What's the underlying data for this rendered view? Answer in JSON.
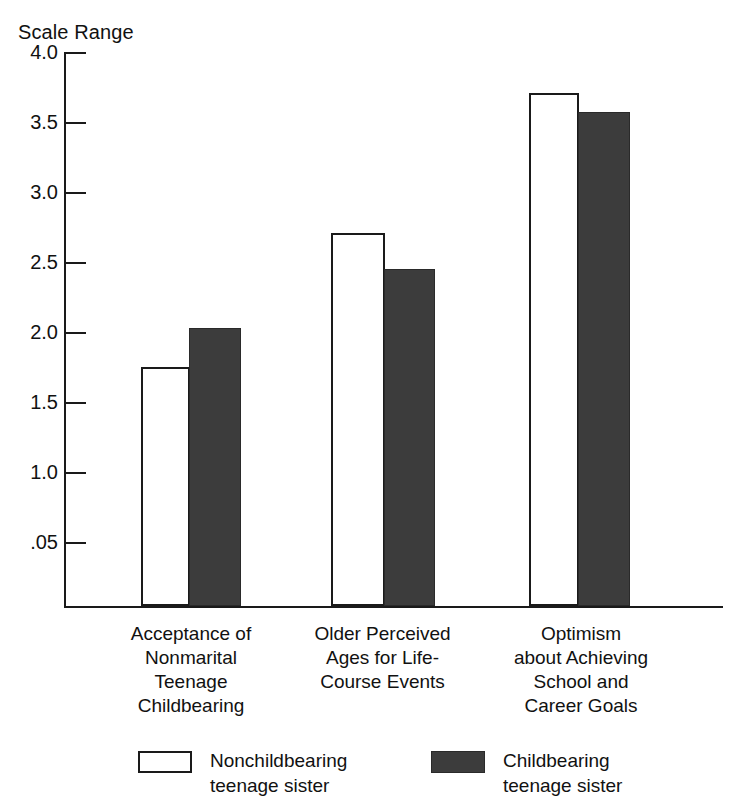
{
  "chart_data": {
    "type": "bar",
    "title": "Scale Range",
    "xlabel": "",
    "ylabel": "Scale Range",
    "ylim": [
      0,
      4.0
    ],
    "grid": false,
    "legend_position": "bottom",
    "y_ticks": [
      "4.0",
      "3.5",
      "3.0",
      "2.5",
      "2.0",
      "1.5",
      "1.0",
      ".05"
    ],
    "y_tick_values": [
      4.0,
      3.5,
      3.0,
      2.5,
      2.0,
      1.5,
      1.0,
      0.5
    ],
    "categories": [
      "Acceptance of Nonmarital Teenage Childbearing",
      "Older Perceived Ages for Life-Course Events",
      "Optimism about Achieving School and Career Goals"
    ],
    "category_lines": [
      [
        "Acceptance of",
        "Nonmarital",
        "Teenage",
        "Childbearing"
      ],
      [
        "Older Perceived",
        "Ages for Life-",
        "Course Events"
      ],
      [
        "Optimism",
        "about Achieving",
        "School and",
        "Career Goals"
      ]
    ],
    "series": [
      {
        "name": "Nonchildbearing teenage sister",
        "color": "#ffffff",
        "values": [
          1.75,
          2.71,
          3.71
        ]
      },
      {
        "name": "Childbearing teenage sister",
        "color": "#3c3c3c",
        "values": [
          2.03,
          2.45,
          3.57
        ]
      }
    ]
  },
  "legend": {
    "items": [
      {
        "swatch": "light",
        "line1": "Nonchildbearing",
        "line2": "teenage sister"
      },
      {
        "swatch": "dark",
        "line1": "Childbearing",
        "line2": "teenage sister"
      }
    ]
  },
  "ticks": {
    "t0": "4.0",
    "t1": "3.5",
    "t2": "3.0",
    "t3": "2.5",
    "t4": "2.0",
    "t5": "1.5",
    "t6": "1.0",
    "t7": ".05"
  },
  "categories": {
    "c0": {
      "l0": "Acceptance of",
      "l1": "Nonmarital",
      "l2": "Teenage",
      "l3": "Childbearing"
    },
    "c1": {
      "l0": "Older Perceived",
      "l1": "Ages for Life-",
      "l2": "Course Events"
    },
    "c2": {
      "l0": "Optimism",
      "l1": "about Achieving",
      "l2": "School and",
      "l3": "Career Goals"
    }
  }
}
